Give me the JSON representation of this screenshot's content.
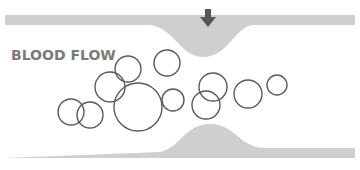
{
  "diagram": {
    "label": "BLOOD FLOW",
    "colors": {
      "vessel_wall": "#cfcfcf",
      "cell_outline": "#5a5a5a",
      "arrow": "#555555",
      "label": "#7a7a7a"
    },
    "arrow_direction": "down",
    "cells": [
      {
        "cx": 128,
        "cy": 69,
        "r": 13
      },
      {
        "cx": 110,
        "cy": 87,
        "r": 15
      },
      {
        "cx": 138,
        "cy": 107,
        "r": 24
      },
      {
        "cx": 167,
        "cy": 63,
        "r": 13
      },
      {
        "cx": 173,
        "cy": 100,
        "r": 11
      },
      {
        "cx": 71,
        "cy": 112,
        "r": 13
      },
      {
        "cx": 90,
        "cy": 115,
        "r": 13
      },
      {
        "cx": 213,
        "cy": 87,
        "r": 14
      },
      {
        "cx": 206,
        "cy": 105,
        "r": 14
      },
      {
        "cx": 248,
        "cy": 94,
        "r": 14
      },
      {
        "cx": 277,
        "cy": 85,
        "r": 10
      }
    ]
  }
}
